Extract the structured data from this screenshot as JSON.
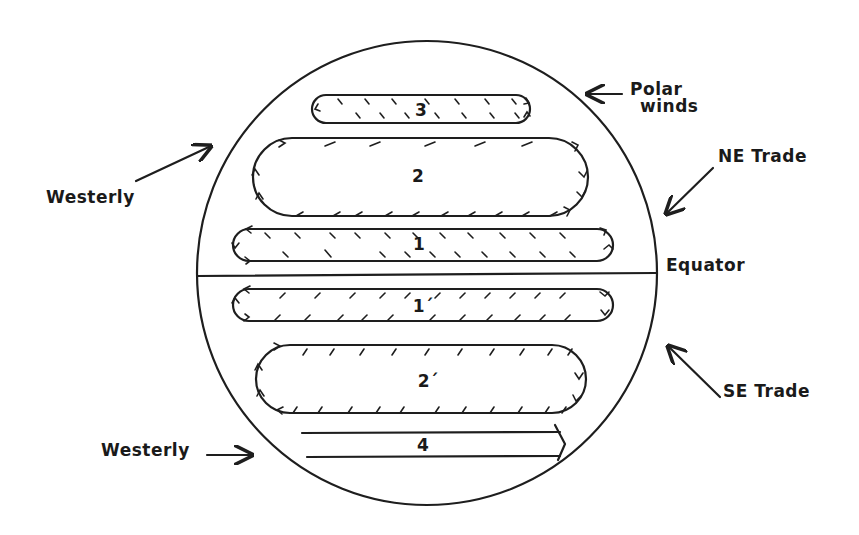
{
  "diagram": {
    "title": "",
    "globe": {
      "cx": 427,
      "cy": 276,
      "rx": 230,
      "ry": 232
    },
    "equator": {
      "label": "Equator",
      "y": 276
    },
    "cells": [
      {
        "id": "3",
        "label": "3",
        "hemisphere": "north",
        "x": 312,
        "y": 95,
        "w": 218,
        "h": 28
      },
      {
        "id": "2",
        "label": "2",
        "hemisphere": "north",
        "x": 253,
        "y": 138,
        "w": 335,
        "h": 78
      },
      {
        "id": "1",
        "label": "1",
        "hemisphere": "north",
        "x": 233,
        "y": 229,
        "w": 380,
        "h": 32
      },
      {
        "id": "1p",
        "label": "1´",
        "hemisphere": "south",
        "x": 233,
        "y": 289,
        "w": 380,
        "h": 32
      },
      {
        "id": "2p",
        "label": "2´",
        "hemisphere": "south",
        "x": 256,
        "y": 345,
        "w": 330,
        "h": 68
      },
      {
        "id": "4",
        "label": "4",
        "hemisphere": "south",
        "type": "arrow-band",
        "x": 302,
        "y": 432,
        "w": 262,
        "h": 26
      }
    ],
    "labels": {
      "polar_winds_line1": "Polar",
      "polar_winds_line2": "winds",
      "ne_trade": "NE Trade",
      "westerly_north": "Westerly",
      "equator": "Equator",
      "se_trade": "SE Trade",
      "westerly_south": "Westerly"
    },
    "cell_labels": {
      "c3": "3",
      "c2": "2",
      "c1": "1",
      "c1p": "1´",
      "c2p": "2´",
      "c4": "4"
    },
    "colors": {
      "ink": "#1e1e1e",
      "background": "#ffffff"
    }
  }
}
